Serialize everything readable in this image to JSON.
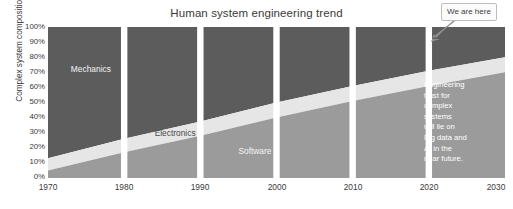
{
  "chart_data": {
    "type": "area",
    "title": "Human system engineering trend",
    "xlabel": "",
    "ylabel": "Complex system composition",
    "x": [
      1970,
      1980,
      1990,
      2000,
      2010,
      2020,
      2030
    ],
    "xtick_labels": [
      "1970",
      "1980",
      "1990",
      "2000",
      "2010",
      "2020",
      "2030"
    ],
    "xlim": [
      1970,
      2030
    ],
    "ylim": [
      0,
      100
    ],
    "ytick_labels": [
      "100%",
      "90%",
      "80%",
      "70%",
      "60%",
      "50%",
      "40%",
      "30%",
      "20%",
      "10%",
      "0%"
    ],
    "ytick_values": [
      100,
      90,
      80,
      70,
      60,
      50,
      40,
      30,
      20,
      10,
      0
    ],
    "grid": false,
    "legend_position": "inline-labels",
    "stacked": true,
    "series": [
      {
        "name": "Software",
        "color": "#9b9b9b",
        "values": [
          5,
          17,
          28,
          40,
          51,
          61,
          70
        ],
        "label_year": 1995,
        "label_pct": 18
      },
      {
        "name": "Electronics",
        "color": "#e6e6e6",
        "values": [
          8,
          9,
          9.5,
          10,
          10,
          10,
          10
        ],
        "cumulative_top": [
          13,
          26,
          37.5,
          50,
          61,
          71,
          80
        ],
        "label_year": 1984,
        "label_pct": 30
      },
      {
        "name": "Mechanics",
        "color": "#5c5c5c",
        "values": [
          87,
          74,
          62.5,
          50,
          39,
          29,
          20
        ],
        "cumulative_top": [
          100,
          100,
          100,
          100,
          100,
          100,
          100
        ],
        "label_year": 1973,
        "label_pct": 72
      }
    ],
    "slab_breaks": [
      1980,
      1990,
      2000,
      2010,
      2020
    ],
    "annotations": [
      {
        "name": "future-note",
        "text": "Engineering\ntrust for\ncomplex\nsystems\nwill lie on\nBig data and\nAI in the\nnear future.",
        "color": "#ffffff"
      },
      {
        "name": "we-are-here-callout",
        "text": "We are here",
        "points_to_year": 2025
      }
    ]
  },
  "chart": {
    "title": "Human system engineering trend",
    "y_axis_title": "Complex system composition",
    "y_ticks": [
      "100%",
      "90%",
      "80%",
      "70%",
      "60%",
      "50%",
      "40%",
      "30%",
      "20%",
      "10%",
      "0%"
    ],
    "x_ticks": [
      "1970",
      "1980",
      "1990",
      "2000",
      "2010",
      "2020",
      "2030"
    ],
    "band_labels": {
      "mechanics": "Mechanics",
      "electronics": "Electronics",
      "software": "Software"
    },
    "annotation_text": "Engineering\ntrust for\ncomplex\nsystems\nwill lie on\nBig data and\nAI in the\nnear future.",
    "callout_text": "We are here",
    "colors": {
      "mechanics": "#5c5c5c",
      "electronics": "#e6e6e6",
      "software": "#9b9b9b",
      "background": "#ffffff",
      "text": "#3b3b3b",
      "callout_border": "#bdbdbd"
    }
  }
}
